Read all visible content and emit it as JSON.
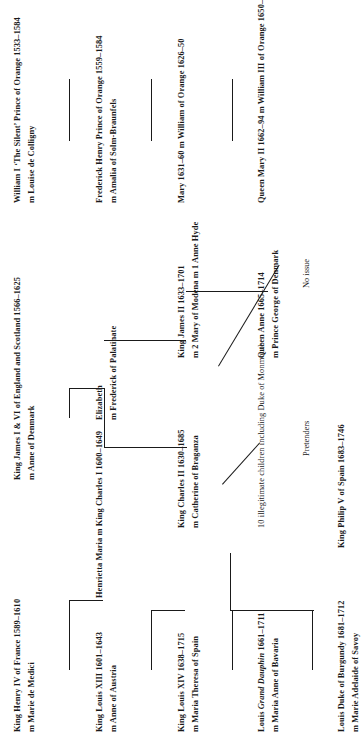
{
  "chart": {
    "type": "genealogy-tree",
    "orientation": "rotated-90-ccw",
    "people": {
      "henry_iv": {
        "l1": "King Henry IV of France 1589–1610",
        "l2": "m Marie de Medici"
      },
      "james_i": {
        "l1": "King James I & VI of England and Scotland 1566–1625",
        "l2": "m Anne of Denmark"
      },
      "william_i": {
        "l1": "William I ‘The Silent’ Prince of Orange 1533–1584",
        "l2": "m Louise de Colligny"
      },
      "louis_xiii": {
        "l1": "King Louis XIII 1601–1643",
        "l2": "m Anne of Austria"
      },
      "charles_i": {
        "l1": "Henrietta Maria m King Charles I 1600–1649",
        "l2": ""
      },
      "elizabeth": {
        "l1": "Elizabeth",
        "l2": "m Frederick of Palatinate"
      },
      "frederick_h": {
        "l1": "Frederick Henry Prince of Orange 1559–1584",
        "l2": "m Amalia of Solm-Braunfels"
      },
      "louis_xiv": {
        "l1": "King Louis XIV 1638–1715",
        "l2": "m Maria Theresa of Spain"
      },
      "charles_ii": {
        "l1": "King Charles II 1630–1685",
        "l2": "m Catherine of Braganza"
      },
      "james_ii": {
        "l1": "King James II 1633–1701",
        "l2": "m 2 Mary of Modena m 1 Anne Hyde"
      },
      "mary_1631": {
        "l1": "Mary 1631–60 m William of Orange 1626–50",
        "l2": ""
      },
      "dauphin": {
        "l1": "Louis Grand Dauphin 1661–1711",
        "l2": "m Maria Anne of Bavaria",
        "italic_part": "Grand Dauphin"
      },
      "monmouth": {
        "l1": "10 illegitimate children including Duke of Monmouth",
        "l2": ""
      },
      "queen_anne": {
        "l1": "Queen Anne 1665–1714",
        "l2": "m Prince George of Denmark"
      },
      "queen_mary_ii": {
        "l1": "Queen Mary II 1662–94 m William III of Orange 1650–1702",
        "l2": ""
      },
      "burgundy": {
        "l1": "Louis Duke of Burgundy 1681–1712",
        "l2": "m Marie Adelaide of Savoy"
      },
      "philip_v": {
        "l1": "King Philip V of Spain 1683–1746",
        "l2": ""
      },
      "pretenders": {
        "l1": "Pretenders",
        "l2": ""
      },
      "no_issue": {
        "l1": "No issue",
        "l2": ""
      },
      "louis_xv": {
        "l1": "King Louis XV 1710–1774",
        "l2": ""
      }
    }
  }
}
